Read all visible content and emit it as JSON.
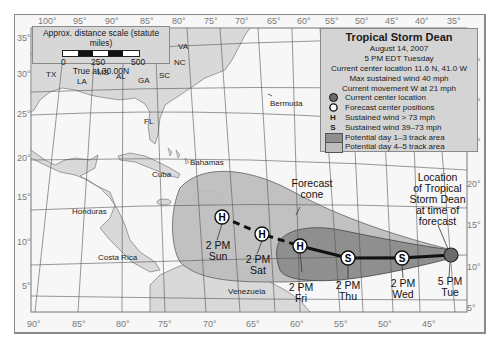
{
  "map": {
    "title": "Tropical Storm Dean",
    "date": "August 14, 2007",
    "time": "5 PM EDT Tuesday",
    "current_location": "Current center location 11.6 N, 41.0 W",
    "max_wind": "Max sustained wind 40 mph",
    "movement": "Current movement W at 21 mph"
  },
  "legend": {
    "items": [
      {
        "symbol": "dark-circle",
        "label": "Current center location"
      },
      {
        "symbol": "open-circle",
        "label": "Forecast center positions"
      },
      {
        "symbol": "H",
        "label": "Sustained wind > 73 mph"
      },
      {
        "symbol": "S",
        "label": "Sustained wind 39–73 mph"
      },
      {
        "symbol": "dark-swatch",
        "label": "Potential day 1–3 track area"
      },
      {
        "symbol": "light-swatch",
        "label": "Potential day 4–5 track area"
      }
    ]
  },
  "scale": {
    "title": "Approx. distance scale (statute miles)",
    "ticks": [
      "0",
      "250",
      "500"
    ],
    "note": "True at 30.00N"
  },
  "axes": {
    "top_lon": [
      "100°",
      "95°",
      "90°",
      "85°",
      "80°",
      "75°",
      "70°",
      "65°",
      "60°",
      "55°",
      "50°",
      "45°",
      "40°",
      "35°"
    ],
    "bottom_lon": [
      "90°",
      "85°",
      "80°",
      "75°",
      "70°",
      "65°",
      "60°",
      "55°",
      "50°",
      "45°"
    ],
    "left_lat": [
      "35°",
      "30°",
      "25°",
      "20°",
      "15°",
      "10°",
      "5°"
    ],
    "right_lat": [
      "35°",
      "30°",
      "25°",
      "20°",
      "15°",
      "10°",
      "5°"
    ]
  },
  "places": {
    "states": [
      "TX",
      "LA",
      "MS",
      "AL",
      "GA",
      "SC",
      "NC",
      "VA",
      "FL"
    ],
    "countries": [
      "Honduras",
      "Costa Rica",
      "Cuba",
      "Bahamas",
      "Venezuela",
      "Bermuda"
    ]
  },
  "annotations": {
    "cone": "Forecast cone",
    "cone_l1": "Forecast",
    "cone_l2": "cone",
    "loc_l1": "Location",
    "loc_l2": "of Tropical",
    "loc_l3": "Storm Dean",
    "loc_l4": "at time of",
    "loc_l5": "forecast"
  },
  "track": [
    {
      "time": "2 PM",
      "day": "Sun",
      "symbol": "H"
    },
    {
      "time": "2 PM",
      "day": "Sat",
      "symbol": "H"
    },
    {
      "time": "2 PM",
      "day": "Fri",
      "symbol": "H"
    },
    {
      "time": "2 PM",
      "day": "Thu",
      "symbol": "S"
    },
    {
      "time": "2 PM",
      "day": "Wed",
      "symbol": "S"
    },
    {
      "time": "5 PM",
      "day": "Tue",
      "symbol": "current"
    }
  ],
  "colors": {
    "land": "#d9d9d9",
    "ocean": "#f7f7f7",
    "cone_day45": "#bdbdbd",
    "cone_day13": "#8f8f8f",
    "legend_bg": "#d4d4d4",
    "current_center": "#6b6b6b"
  }
}
